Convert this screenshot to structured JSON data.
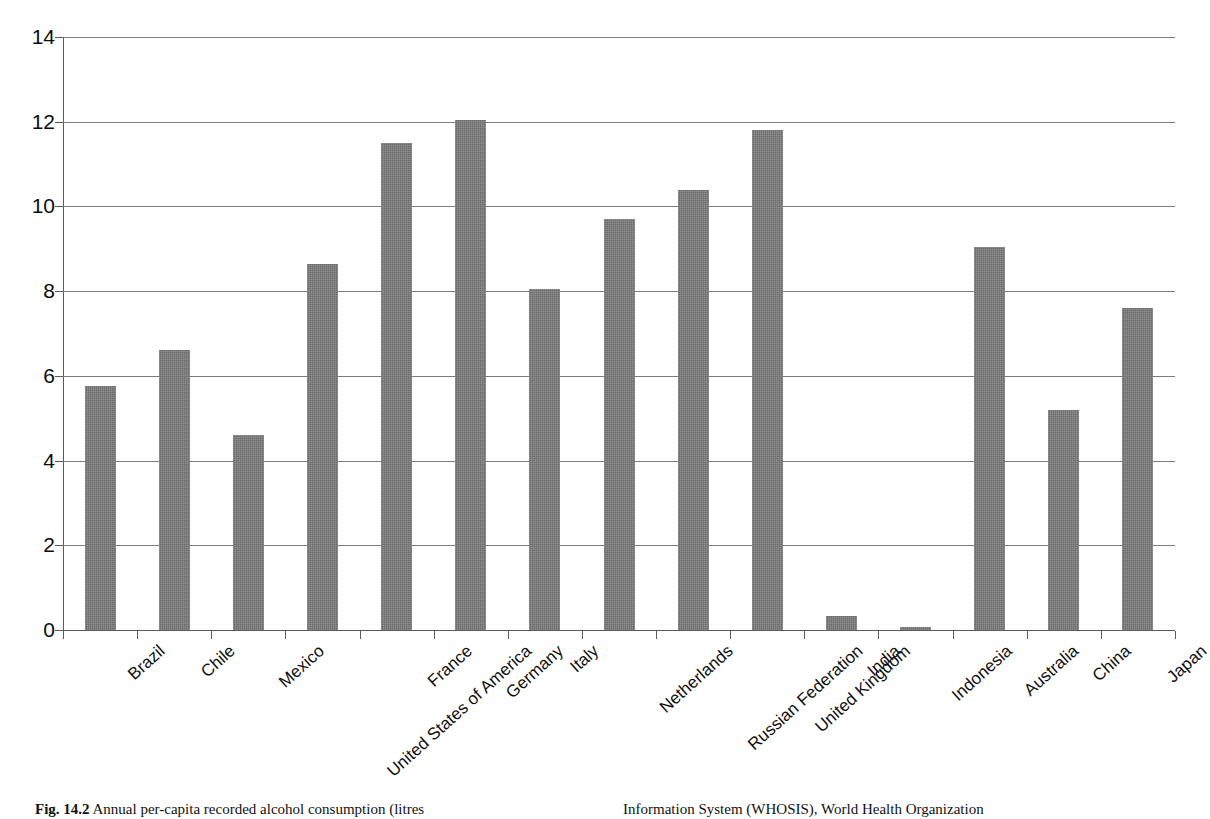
{
  "chart_data": {
    "type": "bar",
    "title": "",
    "xlabel": "",
    "ylabel": "",
    "ylim": [
      0,
      14
    ],
    "yticks": [
      0,
      2,
      4,
      6,
      8,
      10,
      12,
      14
    ],
    "ytick_labels": [
      "0",
      "2",
      "4",
      "6",
      "8",
      "10",
      "12",
      "14"
    ],
    "grid": true,
    "legend": "none",
    "bar_color": "#6b6b6b",
    "categories": [
      "Brazil",
      "Chile",
      "Mexico",
      "United States of America",
      "France",
      "Germany",
      "Italy",
      "Netherlands",
      "Russian Federation",
      "United Kingdom",
      "India",
      "Indonesia",
      "Australia",
      "China",
      "Japan"
    ],
    "values": [
      5.75,
      6.6,
      4.6,
      8.65,
      11.5,
      12.05,
      8.05,
      9.7,
      10.4,
      11.8,
      0.33,
      0.08,
      9.05,
      5.2,
      7.6
    ],
    "series": [
      {
        "name": "Annual per-capita recorded alcohol consumption (litres)",
        "values": [
          5.75,
          6.6,
          4.6,
          8.65,
          11.5,
          12.05,
          8.05,
          9.7,
          10.4,
          11.8,
          0.33,
          0.08,
          9.05,
          5.2,
          7.6
        ]
      }
    ]
  },
  "caption": {
    "fig_number": "Fig. 14.2",
    "left_text": "Annual per-capita recorded alcohol consumption (litres",
    "right_text": "Information System (WHOSIS), World Health Organization"
  }
}
